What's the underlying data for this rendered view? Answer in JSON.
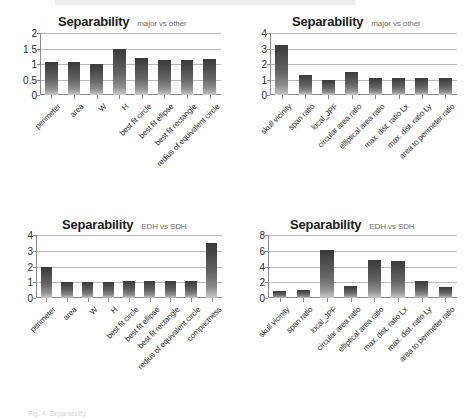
{
  "figure": {
    "caption": "Fig. 4. Separability"
  },
  "chart_data": [
    {
      "type": "bar",
      "panel": "top-left",
      "title": "Separability",
      "subtitle": "major vs other",
      "xlabel": "",
      "ylabel": "",
      "ylim": [
        0,
        2
      ],
      "yticks": [
        0,
        0.5,
        1,
        1.5,
        2
      ],
      "ytick_labels": [
        "0",
        "0.5",
        "1",
        "1.5",
        "2"
      ],
      "grid": true,
      "legend": "none",
      "categories": [
        "perimeter",
        "area",
        "W",
        "H",
        "best fit circle",
        "best fit ellipse",
        "best fit rectangle",
        "redius of equivalent circle"
      ],
      "values": [
        1.08,
        1.06,
        1.01,
        1.49,
        1.18,
        1.12,
        1.13,
        1.16
      ]
    },
    {
      "type": "bar",
      "panel": "top-right",
      "title": "Separability",
      "subtitle": "major vs other",
      "xlabel": "",
      "ylabel": "",
      "ylim": [
        0,
        4
      ],
      "yticks": [
        0,
        1,
        2,
        3,
        4
      ],
      "ytick_labels": [
        "0",
        "1",
        "2",
        "3",
        "4"
      ],
      "grid": true,
      "legend": "none",
      "categories": [
        "skull vicinity",
        "span ratio",
        "local_JPF",
        "circular area ratio",
        "elliptical area ratio",
        "max. dist. ratio Lx",
        "max. dist. ratio Ly",
        "area to perimeter ratio"
      ],
      "values": [
        3.2,
        1.28,
        1.0,
        1.48,
        1.1,
        1.1,
        1.07,
        1.12
      ]
    },
    {
      "type": "bar",
      "panel": "bottom-left",
      "title": "Separability",
      "subtitle": "EDH vs SDH",
      "xlabel": "",
      "ylabel": "",
      "ylim": [
        0,
        4
      ],
      "yticks": [
        0,
        1,
        2,
        3,
        4
      ],
      "ytick_labels": [
        "0",
        "1",
        "2",
        "3",
        "4"
      ],
      "grid": true,
      "legend": "none",
      "categories": [
        "perimeter",
        "area",
        "W",
        "H",
        "best fit circle",
        "best fit ellipse",
        "best fit rectangle",
        "redius of equivalent circle",
        "compactness"
      ],
      "values": [
        2.0,
        1.0,
        1.0,
        1.03,
        1.1,
        1.1,
        1.1,
        1.08,
        3.5
      ]
    },
    {
      "type": "bar",
      "panel": "bottom-right",
      "title": "Separability",
      "subtitle": "EDH vs SDH",
      "xlabel": "",
      "ylabel": "",
      "ylim": [
        0,
        8
      ],
      "yticks": [
        0,
        2,
        4,
        6,
        8
      ],
      "ytick_labels": [
        "0",
        "2",
        "4",
        "6",
        "8"
      ],
      "grid": true,
      "legend": "none",
      "categories": [
        "skull vicinity",
        "span ratio",
        "local_JPF",
        "circular area ratio",
        "elliptical area ratio",
        "max. dist. ratio Lx",
        "max. dist. ratio Ly",
        "area to perimeter ratio"
      ],
      "values": [
        0.95,
        1.05,
        6.15,
        1.5,
        4.85,
        4.75,
        2.15,
        1.4
      ]
    }
  ]
}
